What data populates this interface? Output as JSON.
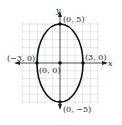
{
  "figure": {
    "type": "ellipse-graph",
    "equation_center": [
      0,
      0
    ],
    "semi_axis_x": 3,
    "semi_axis_y": 5,
    "axes": {
      "x_label": "x",
      "y_label": "y"
    },
    "points": [
      {
        "id": "top",
        "label": "(0, 5)",
        "x": 0,
        "y": 5
      },
      {
        "id": "bottom",
        "label": "(0, −5)",
        "x": 0,
        "y": -5
      },
      {
        "id": "left",
        "label": "(−3, 0)",
        "x": -3,
        "y": 0
      },
      {
        "id": "right",
        "label": "(3, 0)",
        "x": 3,
        "y": 0
      },
      {
        "id": "center",
        "label": "(0, 0)",
        "x": 0,
        "y": 0
      }
    ],
    "colors": {
      "curve": "#111111",
      "grid": "#c8c8c8",
      "axis": "#222222",
      "point": "#111111"
    }
  }
}
